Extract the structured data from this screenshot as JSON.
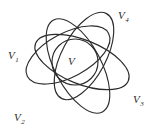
{
  "figure": {
    "type": "venn-like-ellipse-diagram",
    "width": 156,
    "height": 134,
    "background_color": "#ffffff",
    "stroke_color": "#2b2b2b",
    "labels": {
      "center": {
        "base": "V",
        "subscript": ""
      },
      "upper_left": {
        "base": "V",
        "subscript": "1"
      },
      "lower_left": {
        "base": "V",
        "subscript": "2"
      },
      "right": {
        "base": "V",
        "subscript": "3"
      },
      "upper_right": {
        "base": "V",
        "subscript": "4"
      }
    },
    "shapes": [
      {
        "name": "central-circle",
        "label": "V",
        "cx": 75,
        "cy": 62,
        "rx": 23,
        "ry": 23,
        "rotation": 0
      },
      {
        "name": "ellipse-v1",
        "label": "V1",
        "cx": 68,
        "cy": 55,
        "rx": 46,
        "ry": 22,
        "rotation": -28
      },
      {
        "name": "ellipse-v2",
        "label": "V2",
        "cx": 78,
        "cy": 66,
        "rx": 52,
        "ry": 23,
        "rotation": 62
      },
      {
        "name": "ellipse-v3",
        "label": "V3",
        "cx": 82,
        "cy": 62,
        "rx": 50,
        "ry": 22,
        "rotation": 22
      },
      {
        "name": "ellipse-v4",
        "label": "V4",
        "cx": 84,
        "cy": 56,
        "rx": 48,
        "ry": 22,
        "rotation": -62
      }
    ]
  }
}
